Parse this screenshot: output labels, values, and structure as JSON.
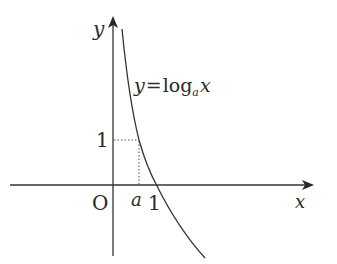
{
  "figure": {
    "type": "function-graph",
    "axes": {
      "x_label": "x",
      "y_label": "y",
      "origin_label": "O"
    },
    "curve": {
      "equation_prefix": "y",
      "equals": "=",
      "function_name": "log",
      "base": "a",
      "argument": "x"
    },
    "ticks": {
      "y_one": "1",
      "x_a": "a",
      "x_one": "1"
    },
    "colors": {
      "line": "#333333",
      "background": "#ffffff"
    }
  }
}
